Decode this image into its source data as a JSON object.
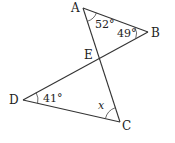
{
  "diagram": {
    "type": "geometry",
    "points": {
      "A": {
        "label": "A",
        "x": 83,
        "y": 8
      },
      "B": {
        "label": "B",
        "x": 148,
        "y": 32
      },
      "C": {
        "label": "C",
        "x": 120,
        "y": 122
      },
      "D": {
        "label": "D",
        "x": 23,
        "y": 100
      },
      "E": {
        "label": "E",
        "x": 100,
        "y": 60
      }
    },
    "segments": [
      "AB",
      "AC",
      "BD",
      "DC"
    ],
    "angles": {
      "A": {
        "label": "52°",
        "vertex": "A"
      },
      "B": {
        "label": "49°",
        "vertex": "B"
      },
      "D": {
        "label": "41°",
        "vertex": "D"
      },
      "C": {
        "label": "x",
        "vertex": "C"
      }
    }
  }
}
